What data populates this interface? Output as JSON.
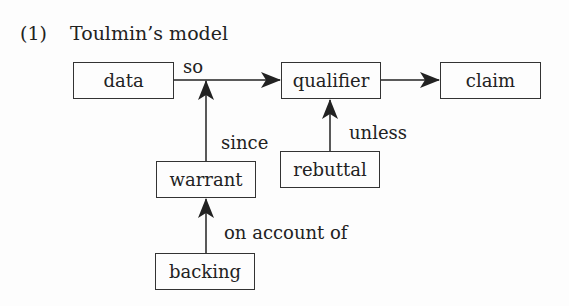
{
  "title": {
    "number": "(1)",
    "text": "Toulmin’s model"
  },
  "nodes": {
    "data": "data",
    "qualifier": "qualifier",
    "claim": "claim",
    "warrant": "warrant",
    "rebuttal": "rebuttal",
    "backing": "backing"
  },
  "edges": {
    "so": "so",
    "since": "since",
    "unless": "unless",
    "on_account_of": "on account of"
  },
  "colors": {
    "line": "#222222",
    "background": "#fdfdfd"
  }
}
